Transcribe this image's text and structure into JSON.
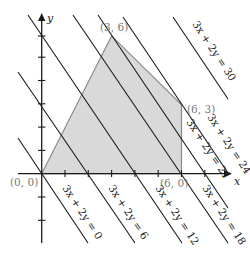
{
  "diagram": {
    "type": "linear-programming-feasible-region",
    "axes": {
      "x_label": "x",
      "y_label": "y",
      "tick_spacing_units": 1
    },
    "feasible_region": {
      "fill": "#d9d9d9",
      "stroke": "#8c8c8c",
      "vertices": [
        [
          0,
          0
        ],
        [
          3,
          6
        ],
        [
          6,
          3
        ],
        [
          6,
          0
        ]
      ]
    },
    "vertex_labels": [
      {
        "text": "(0, 0)"
      },
      {
        "text": "(3, 6)"
      },
      {
        "text": "(6, 3)"
      },
      {
        "text": "(6, 0)"
      }
    ],
    "objective_lines": [
      {
        "c": 0,
        "label": "3x + 2y = 0"
      },
      {
        "c": 6,
        "label": "3x + 2y = 6"
      },
      {
        "c": 12,
        "label": "3x + 2y = 12"
      },
      {
        "c": 18,
        "label": "3x + 2y = 18"
      },
      {
        "c": 21,
        "label": "3x + 2y = 21"
      },
      {
        "c": 24,
        "label": "3x + 2y = 24"
      },
      {
        "c": 30,
        "label": "3x + 2y = 30"
      }
    ],
    "colors": {
      "line": "#1a1a1a",
      "region_fill": "#d9d9d9",
      "region_stroke": "#8c8c8c",
      "point_label": "#7a7a7a"
    }
  }
}
